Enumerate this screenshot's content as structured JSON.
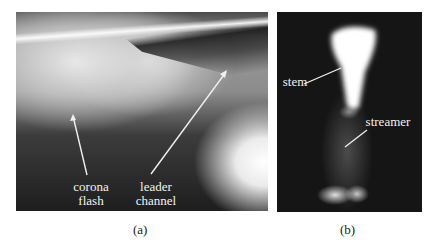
{
  "figure": {
    "panels": [
      {
        "id": "a",
        "caption": "(a)",
        "annotations": [
          {
            "line1": "corona",
            "line2": "flash"
          },
          {
            "line1": "leader",
            "line2": "channel"
          }
        ]
      },
      {
        "id": "b",
        "caption": "(b)",
        "annotations": [
          {
            "line1": "stem"
          },
          {
            "line1": "streamer"
          }
        ]
      }
    ]
  }
}
